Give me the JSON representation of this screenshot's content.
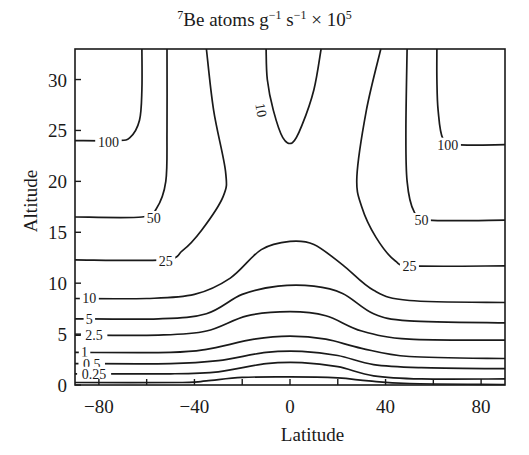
{
  "chart_data": {
    "type": "contour",
    "title_parts": {
      "sup_pre": "7",
      "main": "Be atoms g",
      "exp1": "−1",
      "mid": " s",
      "exp2": "−1",
      "tail": " × 10",
      "exp3": "5"
    },
    "xlabel": "Latitude",
    "ylabel": "Altitude",
    "xlim": [
      -90,
      90
    ],
    "ylim": [
      0,
      33
    ],
    "xticks": [
      -80,
      -60,
      -40,
      -20,
      0,
      20,
      40,
      60,
      80
    ],
    "xtick_labels": [
      "-80",
      "-40",
      "0",
      "40",
      "80"
    ],
    "xtick_label_values": [
      -80,
      -40,
      0,
      40,
      80
    ],
    "yticks": [
      0,
      5,
      10,
      15,
      20,
      25,
      30
    ],
    "ytick_labels": [
      "0",
      "5",
      "10",
      "15",
      "20",
      "25",
      "30"
    ],
    "grid": false,
    "legend": null,
    "contours": [
      {
        "level": "100",
        "side": "left",
        "points": [
          [
            -90,
            24.0
          ],
          [
            -73,
            24.0
          ],
          [
            -67,
            24.3
          ],
          [
            -63,
            26
          ],
          [
            -62,
            29
          ],
          [
            -62,
            33
          ]
        ],
        "label_at": [
          -76,
          23.9
        ]
      },
      {
        "level": "100",
        "side": "right",
        "points": [
          [
            90,
            23.6
          ],
          [
            70,
            23.6
          ],
          [
            64,
            24.2
          ],
          [
            62,
            27
          ],
          [
            61.5,
            30
          ],
          [
            61.5,
            33
          ]
        ],
        "label_at": [
          66,
          23.6
        ]
      },
      {
        "level": "50",
        "side": "left",
        "points": [
          [
            -90,
            16.5
          ],
          [
            -62,
            16.5
          ],
          [
            -56,
            17.3
          ],
          [
            -52,
            20
          ],
          [
            -51.5,
            25
          ],
          [
            -51.5,
            33
          ]
        ],
        "label_at": [
          -57,
          16.4
        ]
      },
      {
        "level": "50",
        "side": "right",
        "points": [
          [
            90,
            16.2
          ],
          [
            58,
            16.2
          ],
          [
            52,
            17
          ],
          [
            49,
            20
          ],
          [
            48.5,
            25
          ],
          [
            49,
            33
          ]
        ],
        "label_at": [
          55,
          16.2
        ]
      },
      {
        "level": "25",
        "side": "left",
        "points": [
          [
            -90,
            12.3
          ],
          [
            -53,
            12.3
          ],
          [
            -45,
            13.2
          ],
          [
            -37,
            15.2
          ],
          [
            -28,
            18.5
          ],
          [
            -27,
            21
          ],
          [
            -32,
            27
          ],
          [
            -35,
            33
          ]
        ],
        "label_at": [
          -52,
          12.2
        ]
      },
      {
        "level": "25",
        "side": "right",
        "points": [
          [
            90,
            11.7
          ],
          [
            52,
            11.7
          ],
          [
            44,
            12.2
          ],
          [
            36,
            14.5
          ],
          [
            30,
            17.5
          ],
          [
            28,
            20.5
          ],
          [
            32,
            27
          ],
          [
            38,
            33
          ]
        ],
        "label_at": [
          50,
          11.7
        ]
      },
      {
        "level": "10",
        "side": "top",
        "points": [
          [
            -10,
            33
          ],
          [
            -9.5,
            30
          ],
          [
            -7,
            27
          ],
          [
            -3,
            24.3
          ],
          [
            1,
            23.8
          ],
          [
            5,
            25.5
          ],
          [
            10,
            29
          ],
          [
            13,
            33
          ]
        ],
        "label_at": [
          -12,
          27
        ]
      },
      {
        "level": "10",
        "side": "full",
        "points": [
          [
            -90,
            8.5
          ],
          [
            -60,
            8.5
          ],
          [
            -40,
            8.9
          ],
          [
            -25,
            10.5
          ],
          [
            -12,
            13.3
          ],
          [
            0,
            14.1
          ],
          [
            10,
            13.8
          ],
          [
            22,
            11.8
          ],
          [
            35,
            9.3
          ],
          [
            50,
            8.3
          ],
          [
            90,
            8.1
          ]
        ],
        "label_at": [
          -84,
          8.5
        ]
      },
      {
        "level": "5",
        "side": "full",
        "points": [
          [
            -90,
            6.5
          ],
          [
            -55,
            6.5
          ],
          [
            -35,
            7.0
          ],
          [
            -20,
            8.9
          ],
          [
            -5,
            9.7
          ],
          [
            10,
            9.7
          ],
          [
            22,
            9.0
          ],
          [
            35,
            7.0
          ],
          [
            50,
            6.3
          ],
          [
            90,
            6.1
          ]
        ],
        "label_at": [
          -84,
          6.5
        ]
      },
      {
        "level": "2.5",
        "side": "full",
        "points": [
          [
            -90,
            4.9
          ],
          [
            -55,
            4.9
          ],
          [
            -35,
            5.3
          ],
          [
            -18,
            6.8
          ],
          [
            0,
            7.2
          ],
          [
            15,
            6.8
          ],
          [
            30,
            5.3
          ],
          [
            50,
            4.5
          ],
          [
            90,
            4.4
          ]
        ],
        "label_at": [
          -82,
          4.9
        ]
      },
      {
        "level": "1",
        "side": "full",
        "points": [
          [
            -90,
            3.2
          ],
          [
            -50,
            3.2
          ],
          [
            -35,
            3.5
          ],
          [
            -15,
            4.5
          ],
          [
            0,
            4.8
          ],
          [
            15,
            4.5
          ],
          [
            30,
            3.6
          ],
          [
            50,
            2.8
          ],
          [
            90,
            2.6
          ]
        ],
        "label_at": [
          -86,
          3.2
        ]
      },
      {
        "level": "0.5",
        "side": "full",
        "points": [
          [
            -90,
            2.1
          ],
          [
            -50,
            2.1
          ],
          [
            -30,
            2.4
          ],
          [
            -10,
            3.2
          ],
          [
            5,
            3.3
          ],
          [
            20,
            2.9
          ],
          [
            35,
            2.0
          ],
          [
            55,
            1.7
          ],
          [
            90,
            1.6
          ]
        ],
        "label_at": [
          -83,
          2.1
        ]
      },
      {
        "level": "0.25",
        "side": "full",
        "points": [
          [
            -90,
            1.1
          ],
          [
            -50,
            1.1
          ],
          [
            -30,
            1.3
          ],
          [
            -10,
            2.1
          ],
          [
            5,
            2.2
          ],
          [
            20,
            1.8
          ],
          [
            35,
            0.9
          ],
          [
            55,
            0.6
          ],
          [
            90,
            0.6
          ]
        ],
        "label_at": [
          -82,
          1.1
        ]
      },
      {
        "level": "",
        "side": "full",
        "points": [
          [
            -90,
            0.25
          ],
          [
            -45,
            0.25
          ],
          [
            -35,
            0.4
          ],
          [
            -20,
            0.75
          ],
          [
            0,
            0.8
          ],
          [
            20,
            0.7
          ],
          [
            33,
            0.4
          ],
          [
            50,
            0.15
          ],
          [
            90,
            0.05
          ]
        ],
        "label_at": null
      }
    ]
  },
  "plot_frame": {
    "left_px": 75,
    "right_px": 505,
    "top_px": 49,
    "bottom_px": 385
  },
  "colors": {
    "line": "#1a1a1a",
    "background": "#ffffff"
  }
}
